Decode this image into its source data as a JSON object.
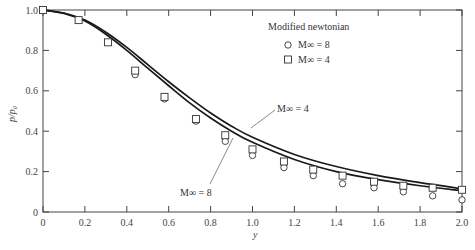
{
  "chart_data": {
    "type": "line",
    "title": "",
    "xlabel": "y",
    "ylabel": "p/p0",
    "xlim": [
      0,
      2.0
    ],
    "ylim": [
      0,
      1.0
    ],
    "grid": false,
    "x_ticks": [
      "0",
      "0.2",
      "0.4",
      "0.6",
      "0.8",
      "1.0",
      "1.2",
      "1.4",
      "1.6",
      "1.8",
      "2.0"
    ],
    "y_ticks": [
      "0",
      "0.2",
      "0.4",
      "0.6",
      "0.8",
      "1.0"
    ],
    "legend": {
      "title": "Modified newtonian",
      "position": "upper right",
      "entries": [
        {
          "marker": "circle",
          "label": "M∞ = 8"
        },
        {
          "marker": "square",
          "label": "M∞ = 4"
        }
      ]
    },
    "series": [
      {
        "name": "M∞ = 4",
        "kind": "line",
        "x": [
          0,
          0.1,
          0.2,
          0.3,
          0.4,
          0.5,
          0.6,
          0.7,
          0.8,
          0.9,
          1.0,
          1.2,
          1.4,
          1.6,
          1.8,
          2.0
        ],
        "y": [
          1.0,
          0.985,
          0.95,
          0.89,
          0.815,
          0.73,
          0.645,
          0.565,
          0.49,
          0.425,
          0.37,
          0.285,
          0.225,
          0.18,
          0.145,
          0.115
        ]
      },
      {
        "name": "M∞ = 8",
        "kind": "line",
        "x": [
          0,
          0.1,
          0.2,
          0.3,
          0.4,
          0.5,
          0.6,
          0.7,
          0.8,
          0.9,
          1.0,
          1.2,
          1.4,
          1.6,
          1.8,
          2.0
        ],
        "y": [
          1.0,
          0.983,
          0.945,
          0.88,
          0.8,
          0.712,
          0.625,
          0.54,
          0.465,
          0.4,
          0.345,
          0.26,
          0.2,
          0.16,
          0.13,
          0.105
        ]
      },
      {
        "name": "Modified newtonian M∞ = 8",
        "kind": "scatter",
        "marker": "circle",
        "x": [
          0.44,
          0.58,
          0.73,
          0.87,
          1.0,
          1.15,
          1.29,
          1.43,
          1.58,
          1.72,
          1.86,
          2.0
        ],
        "y": [
          0.68,
          0.56,
          0.45,
          0.35,
          0.28,
          0.22,
          0.18,
          0.14,
          0.12,
          0.1,
          0.08,
          0.06
        ]
      },
      {
        "name": "Modified newtonian M∞ = 4",
        "kind": "scatter",
        "marker": "square",
        "x": [
          0,
          0.17,
          0.31,
          0.44,
          0.58,
          0.73,
          0.87,
          1.0,
          1.15,
          1.29,
          1.43,
          1.58,
          1.72,
          1.86,
          2.0
        ],
        "y": [
          1.0,
          0.95,
          0.84,
          0.7,
          0.57,
          0.46,
          0.38,
          0.31,
          0.25,
          0.21,
          0.18,
          0.15,
          0.13,
          0.12,
          0.11
        ]
      }
    ],
    "annotations": [
      {
        "text": "M∞ = 4",
        "x": 1.08,
        "y": 0.46,
        "points_to_series": "M∞ = 4"
      },
      {
        "text": "M∞ = 8",
        "x": 0.75,
        "y": 0.12,
        "points_to_series": "M∞ = 8"
      }
    ]
  },
  "labels": {
    "xlabel": "y",
    "ylabel": "p/p₀",
    "legend_title": "Modified newtonian",
    "legend_m8": "M∞ = 8",
    "legend_m4": "M∞ = 4",
    "annot_m4": "M∞ = 4",
    "annot_m8": "M∞ = 8"
  }
}
